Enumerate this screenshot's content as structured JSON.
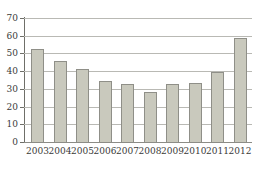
{
  "chart_data": {
    "type": "bar",
    "title": "",
    "subtitle": "",
    "xlabel": "",
    "ylabel": "",
    "categories": [
      "2003",
      "2004",
      "2005",
      "2006",
      "2007",
      "2008",
      "2009",
      "2010",
      "2011",
      "2012"
    ],
    "values": [
      52.5,
      45.5,
      41.5,
      34.5,
      32.5,
      28,
      32.5,
      33.5,
      39.5,
      58.5
    ],
    "ylim": [
      0,
      70
    ],
    "y_ticks": [
      0,
      10,
      20,
      30,
      40,
      50,
      60,
      70
    ],
    "y_tick_labels": [
      "0",
      "10",
      "20",
      "30",
      "40",
      "50",
      "60",
      "70"
    ],
    "grid": true,
    "grid_axis": "y",
    "legend": false,
    "legend_position": "none",
    "bar_fill_color": "#c9c9bd",
    "bar_edge_color": "#8f8f88",
    "gridline_color": "#b9b9b4",
    "axis_color": "#6f6f69",
    "background_color": "#ffffff",
    "text_color": "#3a3a38"
  }
}
